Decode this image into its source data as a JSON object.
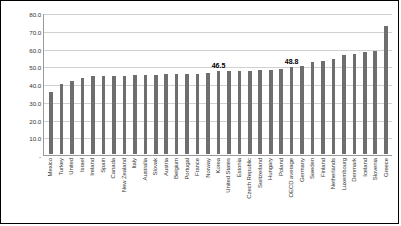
{
  "chart_data": {
    "type": "bar",
    "title": "",
    "xlabel": "",
    "ylabel": "",
    "ylim": [
      0,
      80
    ],
    "ytick_labels": [
      "80.0",
      "70.0",
      "60.0",
      "50.0",
      "40.0",
      "30.0",
      "20.0",
      "10.0",
      "-"
    ],
    "ytick_values": [
      80,
      70,
      60,
      50,
      40,
      30,
      20,
      10,
      0
    ],
    "grid": true,
    "legend": "none",
    "bar_color": "#6e6e6e",
    "categories": [
      "Mexico",
      "Turkey",
      "United",
      "Israel",
      "Ireland",
      "Spain",
      "Canada",
      "New Zealand",
      "Italy",
      "Australia",
      "Slovak",
      "Austria",
      "Belgium",
      "Portugal",
      "France",
      "Norway",
      "Korea",
      "United States",
      "Estonia",
      "Czech Republic",
      "Switzerland",
      "Hungary",
      "Poland",
      "OECD average",
      "Germany",
      "Sweden",
      "Finland",
      "Netherlands",
      "Luxembourg",
      "Denmark",
      "Iceland",
      "Slovenia",
      "Greece"
    ],
    "values": [
      35.2,
      39.7,
      41.4,
      42.9,
      43.8,
      44.0,
      44.1,
      44.2,
      44.3,
      44.5,
      44.6,
      44.9,
      45.0,
      45.2,
      45.3,
      45.5,
      46.5,
      46.6,
      46.8,
      47.0,
      47.2,
      47.6,
      48.0,
      48.8,
      49.4,
      51.8,
      52.4,
      53.8,
      55.6,
      56.5,
      57.5,
      58.2,
      72.0
    ],
    "point_labels": [
      {
        "category": "Korea",
        "text": "46.5"
      },
      {
        "category": "OECD average",
        "text": "48.8"
      }
    ]
  }
}
